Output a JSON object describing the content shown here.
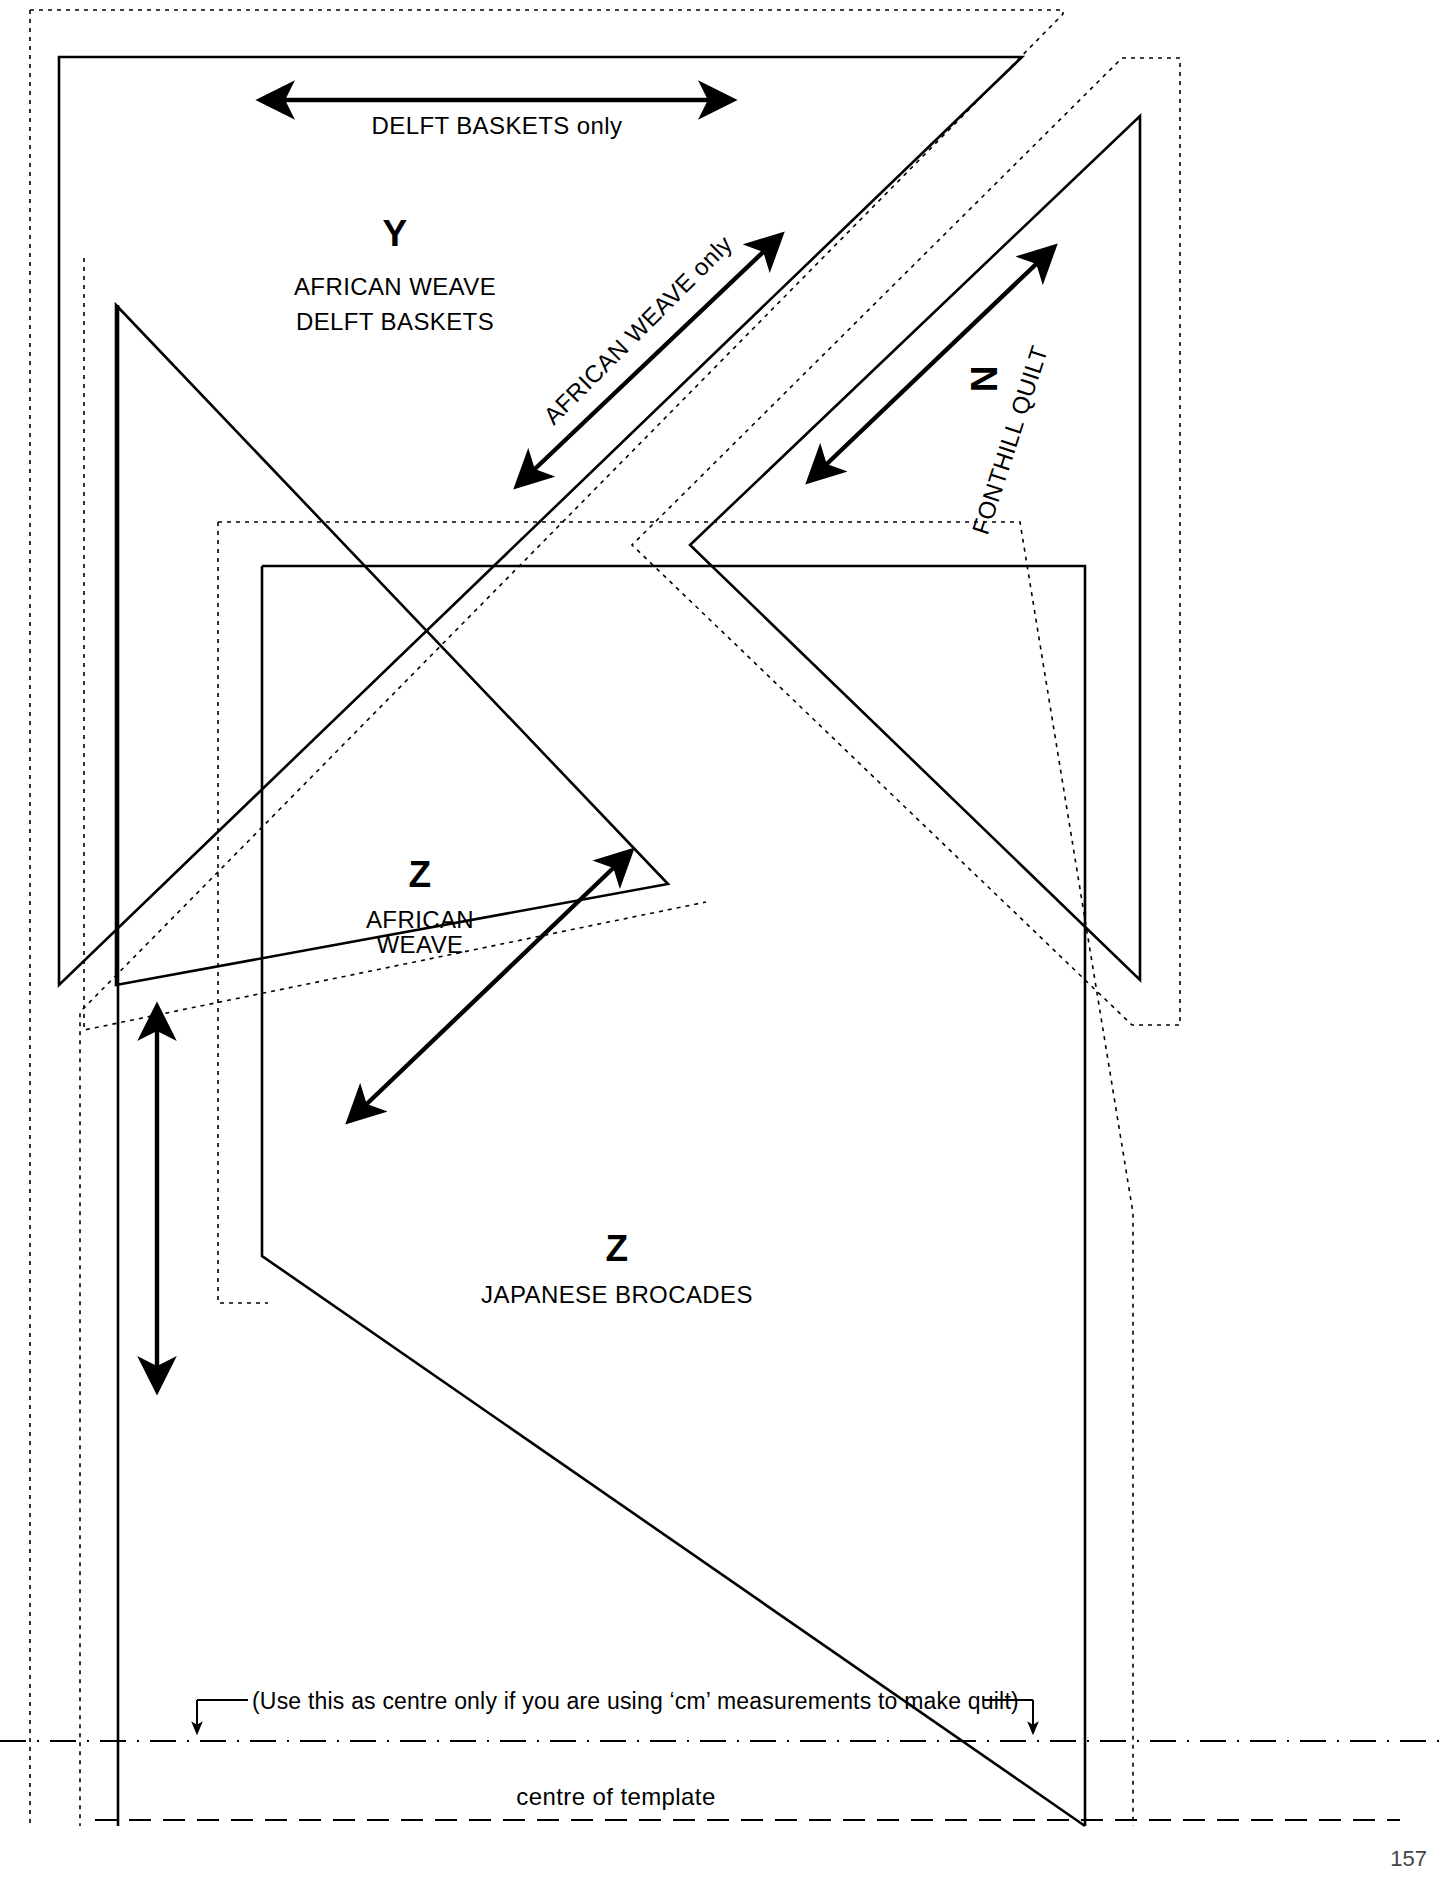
{
  "document": {
    "type": "quilt-template-sheet",
    "title": "Quilt template cutting sheet",
    "background_color": "#ffffff",
    "line_color": "#000000"
  },
  "labels": {
    "delft_only": "DELFT BASKETS only",
    "piece_y": {
      "letter": "Y",
      "line1": "AFRICAN WEAVE",
      "line2": "DELFT BASKETS"
    },
    "african_weave_only": "AFRICAN WEAVE only",
    "piece_n": {
      "letter": "N",
      "line1": "FONTHILL QUILT"
    },
    "piece_z_african": {
      "letter": "Z",
      "line1": "AFRICAN",
      "line2": "WEAVE"
    },
    "piece_z_japanese": {
      "letter": "Z",
      "line1": "JAPANESE BROCADES"
    },
    "cm_note": "(Use this as centre only if you are using ‘cm’ measurements to make quilt)",
    "centre_of_template": "centre of template",
    "page_number": "157"
  },
  "arrows": {
    "horizontal_top": {
      "name": "grain-line-delft",
      "x1": 256,
      "y1": 100,
      "x2": 737,
      "y2": 100
    },
    "diagonal_upper": {
      "name": "grain-line-african-weave",
      "x1": 514,
      "y1": 489,
      "x2": 784,
      "y2": 232
    },
    "diagonal_right": {
      "name": "grain-line-fonthill",
      "x1": 806,
      "y1": 484,
      "x2": 1057,
      "y2": 244
    },
    "diagonal_lower": {
      "name": "grain-line-z-african",
      "x1": 346,
      "y1": 1124,
      "x2": 634,
      "y2": 848
    },
    "vertical_left": {
      "name": "grain-line-vertical",
      "x1": 157,
      "y1": 1003,
      "x2": 157,
      "y2": 1394
    }
  },
  "geometry": {
    "solid_outlines": [
      {
        "name": "template-y-outline",
        "points": "59,57 1022,57 59,985 59,57"
      },
      {
        "name": "template-n-outline",
        "points": "1140,116 1140,980 690,545 1140,116"
      },
      {
        "name": "template-z-african-outline",
        "points": "116,305 665,880 116,985 116,305"
      },
      {
        "name": "template-z-japanese-outline",
        "points": "262,566 1085,566 1085,1760 262,1256 262,566"
      }
    ],
    "dotted_outlines": [
      {
        "name": "seam-allowance-y",
        "points": "28,14 1058,14 1058,26 95,1017 28,1017 28,14"
      },
      {
        "name": "seam-allowance-n",
        "points": "1124,58 1176,58 1176,1020 640,545 1124,58"
      },
      {
        "name": "seam-allowance-z-african",
        "points": "82,262 700,900 82,1028 82,262"
      },
      {
        "name": "seam-allowance-z-japanese",
        "points": "218,522 1130,522 1130,1800 218,1300 218,522"
      }
    ],
    "centre_lines": [
      {
        "name": "cm-centre-line",
        "y": 1741,
        "style": "dash-dot"
      },
      {
        "name": "template-centre-line",
        "y": 1820,
        "style": "dashed"
      }
    ]
  }
}
